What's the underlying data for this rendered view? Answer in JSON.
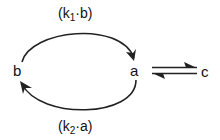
{
  "diagram": {
    "nodes": {
      "b": "b",
      "a": "a",
      "c": "c"
    },
    "edges": {
      "top": {
        "from": "b",
        "to": "a",
        "label_open": "(k",
        "label_sub": "1",
        "label_rest": "·b)"
      },
      "bottom": {
        "from": "a",
        "to": "b",
        "label_open": "(k",
        "label_sub": "2",
        "label_rest": "·a)"
      },
      "equilibrium": {
        "between": [
          "a",
          "c"
        ],
        "type": "reversible-half-arrows"
      }
    },
    "colors": {
      "stroke": "#222222",
      "text": "#111111",
      "background": "#ffffff"
    }
  }
}
